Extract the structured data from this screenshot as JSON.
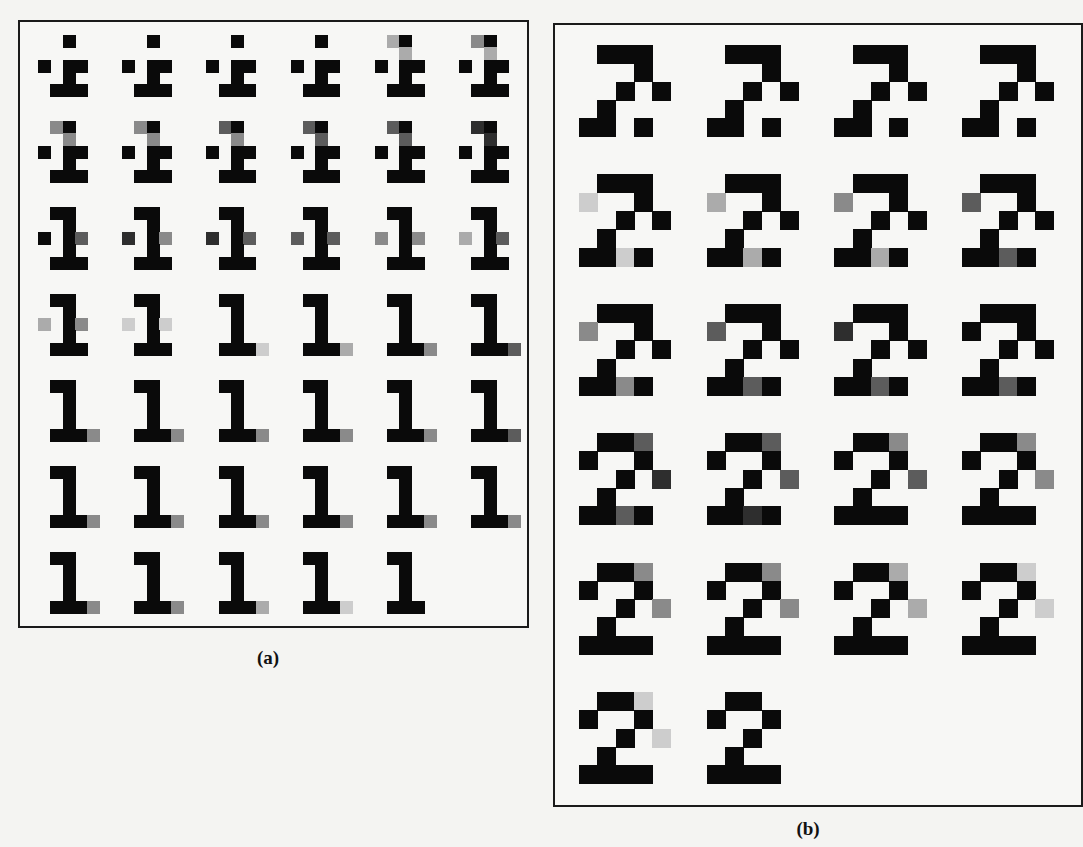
{
  "figure": {
    "panels": [
      {
        "id": "a",
        "caption": "(a)",
        "digit": "1",
        "cell_px": 12.3,
        "origin": [
          38,
          35
        ],
        "col_step": 84.2,
        "row_step": 86.2,
        "glyphs": [
          [
            [
              "..#..",
              ".....",
              "#.##.",
              "..#..",
              ".###."
            ],
            [
              "..#..",
              ".....",
              "#.##.",
              "..#..",
              ".###."
            ],
            [
              "..#..",
              ".....",
              "#.##.",
              "..#..",
              ".###."
            ],
            [
              "..#..",
              ".....",
              "#.##.",
              "..#..",
              ".###."
            ],
            [
              ".3#..",
              "..3..",
              "#.##.",
              "..#..",
              ".###."
            ],
            [
              ".5#..",
              "..3..",
              "#.##.",
              "..#..",
              ".###."
            ]
          ],
          [
            [
              ".5#..",
              "..5..",
              "#.##.",
              "..#..",
              ".###."
            ],
            [
              ".5#..",
              "..5..",
              "#.##.",
              "..#..",
              ".###."
            ],
            [
              ".7#..",
              "..5..",
              "#.##.",
              "..#..",
              ".###."
            ],
            [
              ".7#..",
              "..7..",
              "#.##.",
              "..#..",
              ".###."
            ],
            [
              ".7#..",
              "..7..",
              "#.##.",
              "..#..",
              ".###."
            ],
            [
              ".9#..",
              "..9..",
              "#.##.",
              "..#..",
              ".###."
            ]
          ],
          [
            [
              ".##..",
              "..#..",
              "#.#7.",
              "..#..",
              ".###."
            ],
            [
              ".##..",
              "..#..",
              "9.#5.",
              "..#..",
              ".###."
            ],
            [
              ".##..",
              "..#..",
              "9.#7.",
              "..#..",
              ".###."
            ],
            [
              ".##..",
              "..#..",
              "7.#7.",
              "..#..",
              ".###."
            ],
            [
              ".##..",
              "..#..",
              "5.#5.",
              "..#..",
              ".###."
            ],
            [
              ".##..",
              "..#..",
              "3.#7.",
              "..#..",
              ".###."
            ]
          ],
          [
            [
              ".##..",
              "..#..",
              "3.#5.",
              "..#..",
              ".###."
            ],
            [
              ".##..",
              "..#..",
              "1.#1.",
              "..#..",
              ".###."
            ],
            [
              ".##..",
              "..#..",
              "..#..",
              "..#..",
              ".###1"
            ],
            [
              ".##..",
              "..#..",
              "..#..",
              "..#..",
              ".###3"
            ],
            [
              ".##..",
              "..#..",
              "..#..",
              "..#..",
              ".###5"
            ],
            [
              ".##..",
              "..#..",
              "..#..",
              "..#..",
              ".###7"
            ]
          ],
          [
            [
              ".##..",
              "..#..",
              "..#..",
              "..#..",
              ".###5"
            ],
            [
              ".##..",
              "..#..",
              "..#..",
              "..#..",
              ".###5"
            ],
            [
              ".##..",
              "..#..",
              "..#..",
              "..#..",
              ".###5"
            ],
            [
              ".##..",
              "..#..",
              "..#..",
              "..#..",
              ".###5"
            ],
            [
              ".##..",
              "..#..",
              "..#..",
              "..#..",
              ".###5"
            ],
            [
              ".##..",
              "..#..",
              "..#..",
              "..#..",
              ".###7"
            ]
          ],
          [
            [
              ".##..",
              "..#..",
              "..#..",
              "..#..",
              ".###5"
            ],
            [
              ".##..",
              "..#..",
              "..#..",
              "..#..",
              ".###5"
            ],
            [
              ".##..",
              "..#..",
              "..#..",
              "..#..",
              ".###5"
            ],
            [
              ".##..",
              "..#..",
              "..#..",
              "..#..",
              ".###5"
            ],
            [
              ".##..",
              "..#..",
              "..#..",
              "..#..",
              ".###5"
            ],
            [
              ".##..",
              "..#..",
              "..#..",
              "..#..",
              ".###5"
            ]
          ],
          [
            [
              ".##..",
              "..#..",
              "..#..",
              "..#..",
              ".###5"
            ],
            [
              ".##..",
              "..#..",
              "..#..",
              "..#..",
              ".###5"
            ],
            [
              ".##..",
              "..#..",
              "..#..",
              "..#..",
              ".###3"
            ],
            [
              ".##..",
              "..#..",
              "..#..",
              "..#..",
              ".###1"
            ],
            [
              ".##..",
              "..#..",
              "..#..",
              "..#..",
              ".###."
            ]
          ]
        ]
      },
      {
        "id": "b",
        "caption": "(b)",
        "digit": "2",
        "cell_px": 18.3,
        "origin": [
          579,
          45
        ],
        "col_step": 127.7,
        "row_step": 129.4,
        "glyphs": [
          [
            [
              ".###.",
              "...#.",
              "..#.#",
              ".#...",
              "##.#."
            ],
            [
              ".###.",
              "...#.",
              "..#.#",
              ".#...",
              "##.#."
            ],
            [
              ".###.",
              "...#.",
              "..#.#",
              ".#...",
              "##.#."
            ],
            [
              ".###.",
              "...#.",
              "..#.#",
              ".#...",
              "##.#."
            ]
          ],
          [
            [
              ".###.",
              "1..#.",
              "..#.#",
              ".#...",
              "##1#."
            ],
            [
              ".###.",
              "3..#.",
              "..#.#",
              ".#...",
              "##3#."
            ],
            [
              ".###.",
              "5..#.",
              "..#.#",
              ".#...",
              "##3#."
            ],
            [
              ".###.",
              "7..#.",
              "..#.#",
              ".#...",
              "##7#."
            ]
          ],
          [
            [
              ".###.",
              "5..#.",
              "..#.#",
              ".#...",
              "##5#."
            ],
            [
              ".###.",
              "7..#.",
              "..#.#",
              ".#...",
              "##7#."
            ],
            [
              ".###.",
              "9..#.",
              "..#.#",
              ".#...",
              "##7#."
            ],
            [
              ".###.",
              "#..#.",
              "..#.#",
              ".#...",
              "##7#."
            ]
          ],
          [
            [
              ".##7.",
              "#..#.",
              "..#.9",
              ".#...",
              "##7#."
            ],
            [
              ".##7.",
              "#..#.",
              "..#.7",
              ".#...",
              "##9#."
            ],
            [
              ".##5.",
              "#..#.",
              "..#.7",
              ".#...",
              "####."
            ],
            [
              ".##5.",
              "#..#.",
              "..#.5",
              ".#...",
              "####."
            ]
          ],
          [
            [
              ".##5.",
              "#..#.",
              "..#.5",
              ".#...",
              "####."
            ],
            [
              ".##5.",
              "#..#.",
              "..#.5",
              ".#...",
              "####."
            ],
            [
              ".##3.",
              "#..#.",
              "..#.3",
              ".#...",
              "####."
            ],
            [
              ".##1.",
              "#..#.",
              "..#.1",
              ".#...",
              "####."
            ]
          ],
          [
            [
              ".##1.",
              "#..#.",
              "..#.1",
              ".#...",
              "####."
            ],
            [
              ".##..",
              "#..#.",
              "..#..",
              ".#...",
              "####."
            ]
          ]
        ]
      }
    ],
    "gray_levels": {
      "#": "#0a0a0a",
      "9": "#2e2e2e",
      "7": "#5c5c5c",
      "5": "#8a8a8a",
      "3": "#ababab",
      "1": "#cdcdcd"
    }
  }
}
